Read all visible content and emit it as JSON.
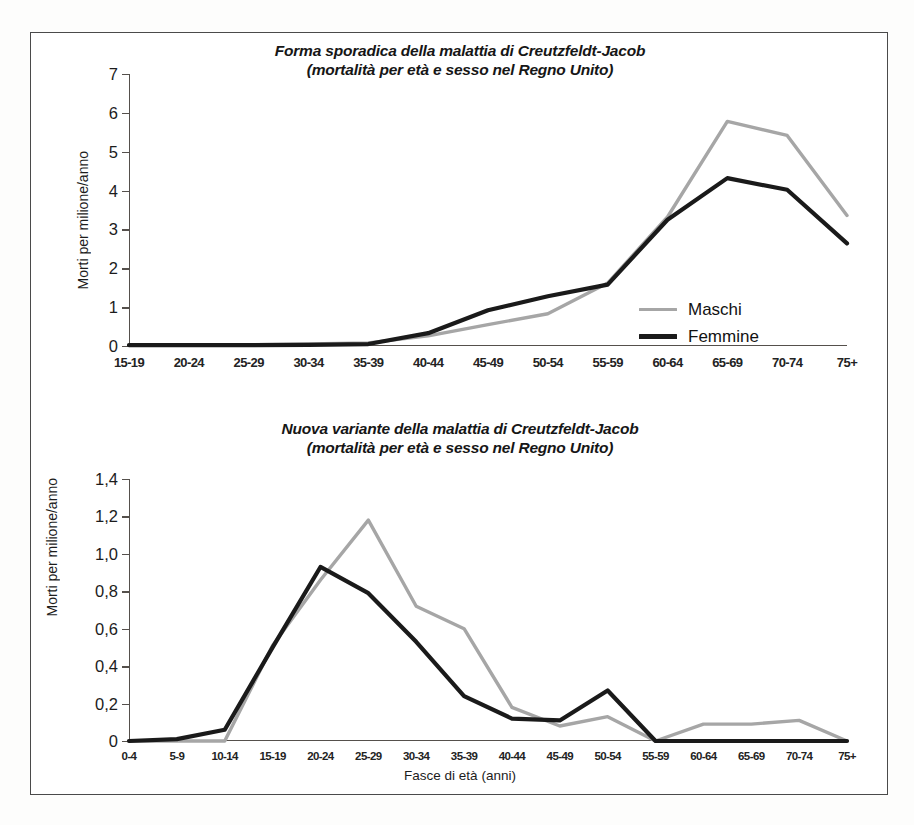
{
  "figure": {
    "legend_labels": {
      "male": "Maschi",
      "female": "Femmine"
    },
    "colors": {
      "male": "#a6a6a6",
      "female": "#1a1a1a",
      "axis": "#55504c",
      "frame": "#4a4a4a"
    }
  },
  "chart_data": [
    {
      "id": "sporadic-cjd",
      "type": "line",
      "title": "Forma sporadica della malattia di Creutzfeldt-Jacob",
      "subtitle": "(mortalità per età e sesso nel Regno Unito)",
      "xlabel": "",
      "ylabel": "Morti per milione/anno",
      "ylim": [
        0,
        7
      ],
      "yticks": [
        0,
        1,
        2,
        3,
        4,
        5,
        6,
        7
      ],
      "ytick_labels": [
        "0",
        "1",
        "2",
        "3",
        "4",
        "5",
        "6",
        "7"
      ],
      "grid": false,
      "legend_position": "inside-right",
      "categories": [
        "15-19",
        "20-24",
        "25-29",
        "30-34",
        "35-39",
        "40-44",
        "45-49",
        "50-54",
        "55-59",
        "60-64",
        "65-69",
        "70-74",
        "75+"
      ],
      "series": [
        {
          "name": "Maschi",
          "color": "#a6a6a6",
          "values": [
            0.02,
            0.02,
            0.03,
            0.05,
            0.08,
            0.26,
            0.55,
            0.83,
            1.62,
            3.32,
            5.78,
            5.42,
            3.36
          ]
        },
        {
          "name": "Femmine",
          "color": "#1a1a1a",
          "values": [
            0.02,
            0.02,
            0.02,
            0.03,
            0.05,
            0.33,
            0.92,
            1.28,
            1.58,
            3.25,
            4.32,
            4.02,
            2.64
          ]
        }
      ]
    },
    {
      "id": "variant-cjd",
      "type": "line",
      "title": "Nuova variante della malattia di Creutzfeldt-Jacob",
      "subtitle": "(mortalità per età e sesso nel Regno Unito)",
      "xlabel": "Fasce di età (anni)",
      "ylabel": "Morti per milione/anno",
      "ylim": [
        0,
        1.4
      ],
      "yticks": [
        0,
        0.2,
        0.4,
        0.6,
        0.8,
        1.0,
        1.2,
        1.4
      ],
      "ytick_labels": [
        "0",
        "0,2",
        "0,4",
        "0,6",
        "0,8",
        "1,0",
        "1,2",
        "1,4"
      ],
      "grid": false,
      "legend_position": "inside-right",
      "categories": [
        "0-4",
        "5-9",
        "10-14",
        "15-19",
        "20-24",
        "25-29",
        "30-34",
        "35-39",
        "40-44",
        "45-49",
        "50-54",
        "55-59",
        "60-64",
        "65-69",
        "70-74",
        "75+"
      ],
      "series": [
        {
          "name": "Maschi",
          "color": "#a6a6a6",
          "values": [
            0.0,
            0.0,
            0.0,
            0.51,
            0.86,
            1.18,
            0.72,
            0.6,
            0.18,
            0.08,
            0.13,
            0.0,
            0.09,
            0.09,
            0.11,
            0.0
          ]
        },
        {
          "name": "Femmine",
          "color": "#1a1a1a",
          "values": [
            0.0,
            0.01,
            0.06,
            0.5,
            0.93,
            0.79,
            0.53,
            0.24,
            0.12,
            0.11,
            0.27,
            0.0,
            0.0,
            0.0,
            0.0,
            0.0
          ]
        }
      ]
    }
  ]
}
